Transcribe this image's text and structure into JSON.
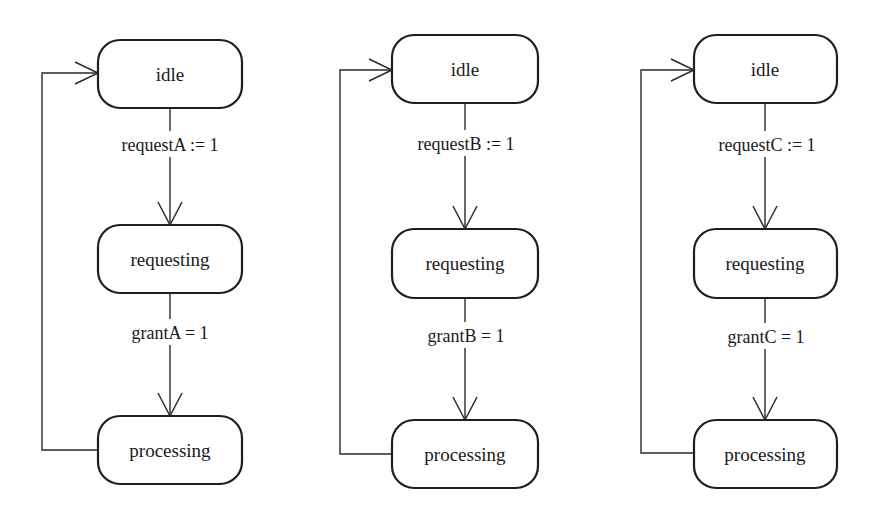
{
  "diagrams": [
    {
      "id": "A",
      "states": {
        "idle": "idle",
        "requesting": "requesting",
        "processing": "processing"
      },
      "transitions": {
        "idle_to_requesting": "requestA := 1",
        "requesting_to_processing": "grantA = 1"
      }
    },
    {
      "id": "B",
      "states": {
        "idle": "idle",
        "requesting": "requesting",
        "processing": "processing"
      },
      "transitions": {
        "idle_to_requesting": "requestB := 1",
        "requesting_to_processing": "grantB = 1"
      }
    },
    {
      "id": "C",
      "states": {
        "idle": "idle",
        "requesting": "requesting",
        "processing": "processing"
      },
      "transitions": {
        "idle_to_requesting": "requestC := 1",
        "requesting_to_processing": "grantC = 1"
      }
    }
  ]
}
